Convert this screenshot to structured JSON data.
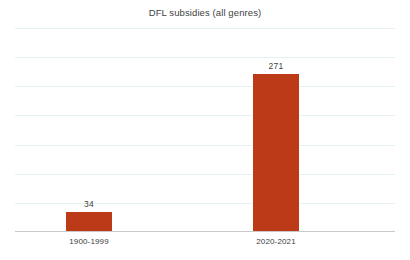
{
  "chart_data": {
    "type": "bar",
    "title": "DFL subsidies (all genres)",
    "xlabel": "",
    "ylabel": "",
    "categories": [
      "1900-1999",
      "2020-2021"
    ],
    "values": [
      34,
      271
    ],
    "data_labels": [
      "34",
      "271"
    ],
    "series": [
      {
        "name": "DFL subsidies",
        "values": [
          34,
          271
        ],
        "color": "#bc3a18"
      }
    ],
    "ylim": [
      0,
      350
    ],
    "y_tick_interval": 50,
    "y_tick_values": [
      0,
      50,
      100,
      150,
      200,
      250,
      300,
      350
    ],
    "y_axis_labels_visible": false,
    "gridlines": {
      "horizontal": true,
      "vertical": false,
      "count": 7,
      "color": "#e6f1f1"
    },
    "axis_line_color": "#c9c9c9",
    "legend": {
      "visible": false,
      "position": "none",
      "entries": []
    },
    "annotations": [],
    "background_color": "#ffffff",
    "title_color": "#3f3f3f",
    "label_color": "#3d3d3d"
  }
}
